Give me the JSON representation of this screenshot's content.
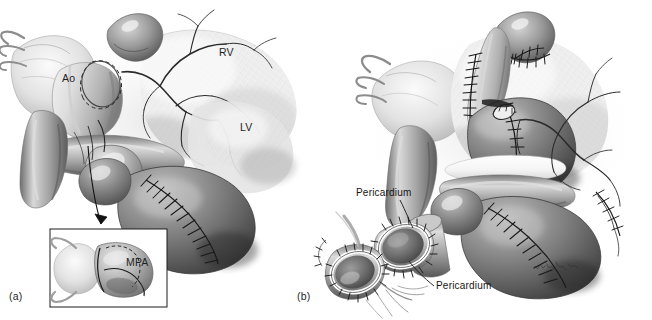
{
  "figure": {
    "kind": "surgical-illustration",
    "style": "grayscale-pencil-airbrush",
    "background_color": "#ffffff",
    "ink_color": "#1c1c1c",
    "width": 652,
    "height": 320,
    "panels": [
      {
        "id": "a",
        "label": "(a)",
        "label_x": 9,
        "label_y": 296,
        "description": "Heart with aorta and main pulmonary artery, dashed transection lines, sutured ventricular patch"
      },
      {
        "id": "b",
        "label": "(b)",
        "label_x": 297,
        "label_y": 296,
        "description": "Completed reconstruction with pericardial patches and separate detail of cut vessel ends"
      }
    ],
    "anatomy_labels": [
      {
        "id": "ao",
        "text": "Ao",
        "x": 62,
        "y": 78,
        "panel": "a"
      },
      {
        "id": "rv",
        "text": "RV",
        "x": 219,
        "y": 52,
        "panel": "a"
      },
      {
        "id": "lv",
        "text": "LV",
        "x": 240,
        "y": 127,
        "panel": "a"
      },
      {
        "id": "mpa",
        "text": "MPA",
        "x": 126,
        "y": 262,
        "panel": "a"
      }
    ],
    "callout_labels": [
      {
        "id": "pericardium-upper",
        "text": "Pericardium",
        "x": 356,
        "y": 194,
        "panel": "b"
      },
      {
        "id": "pericardium-lower",
        "text": "Pericardium",
        "x": 436,
        "y": 287,
        "panel": "b"
      }
    ],
    "inset": {
      "id": "mpa-detail-inset",
      "x": 50,
      "y": 229,
      "width": 117,
      "height": 78,
      "border_color": "#1c1c1c",
      "border_width": 1
    },
    "arrow": {
      "id": "inset-pointer-arrow",
      "from_x": 88,
      "from_y": 146,
      "to_x": 104,
      "to_y": 230
    },
    "leaders": [
      {
        "id": "leader-pericardium-upper",
        "x1": 400,
        "y1": 200,
        "x2": 413,
        "y2": 227
      },
      {
        "id": "leader-pericardium-lower",
        "x1": 434,
        "y1": 285,
        "x2": 409,
        "y2": 262
      }
    ],
    "signature": {
      "text": "KDesign",
      "x": 540,
      "y": 268
    }
  }
}
